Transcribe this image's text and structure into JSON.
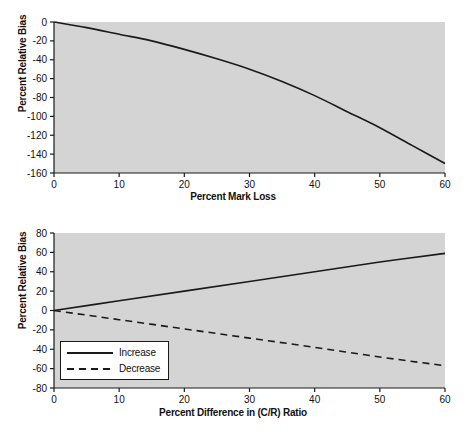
{
  "figure": {
    "background_color": "#ffffff",
    "plot_background_color": "#d4d4d4",
    "line_color": "#1a1a1a"
  },
  "chart_data": [
    {
      "id": "top",
      "type": "line",
      "title": "",
      "xlabel": "Percent Mark Loss",
      "ylabel": "Percent Relative Bias",
      "xlim": [
        0,
        60
      ],
      "ylim": [
        -160,
        0
      ],
      "xticks": [
        0,
        10,
        20,
        30,
        40,
        50,
        60
      ],
      "yticks": [
        0,
        -20,
        -40,
        -60,
        -80,
        -100,
        -120,
        -140,
        -160
      ],
      "xticklabels": [
        "0",
        "10",
        "20",
        "30",
        "40",
        "50",
        "60"
      ],
      "yticklabels": [
        "0",
        "-20",
        "-40",
        "-60",
        "-80",
        "-100",
        "-120",
        "-140",
        "-160"
      ],
      "grid": false,
      "legend": null,
      "series": [
        {
          "name": "Percent Relative Bias",
          "style": "solid",
          "x": [
            0,
            5,
            10,
            15,
            20,
            25,
            30,
            35,
            40,
            45,
            50,
            55,
            60
          ],
          "values": [
            0,
            -6,
            -13,
            -20,
            -29,
            -39,
            -50,
            -63,
            -78,
            -95,
            -112,
            -131,
            -150
          ]
        }
      ]
    },
    {
      "id": "bottom",
      "type": "line",
      "title": "",
      "xlabel": "Percent Difference in (C/R) Ratio",
      "ylabel": "Percent Relative Bias",
      "xlim": [
        0,
        60
      ],
      "ylim": [
        -80,
        80
      ],
      "xticks": [
        0,
        10,
        20,
        30,
        40,
        50,
        60
      ],
      "yticks": [
        80,
        60,
        40,
        20,
        0,
        -20,
        -40,
        -60,
        -80
      ],
      "xticklabels": [
        "0",
        "10",
        "20",
        "30",
        "40",
        "50",
        "60"
      ],
      "yticklabels": [
        "80",
        "60",
        "40",
        "20",
        "0",
        "-20",
        "-40",
        "-60",
        "-80"
      ],
      "grid": false,
      "legend": {
        "position": "lower-left",
        "entries": [
          {
            "label": "Increase",
            "style": "solid"
          },
          {
            "label": "Decrease",
            "style": "dashed"
          }
        ]
      },
      "series": [
        {
          "name": "Increase",
          "style": "solid",
          "x": [
            0,
            10,
            20,
            30,
            40,
            50,
            60
          ],
          "values": [
            0,
            10,
            20,
            30,
            40,
            50,
            59
          ]
        },
        {
          "name": "Decrease",
          "style": "dashed",
          "x": [
            0,
            10,
            20,
            30,
            40,
            50,
            60
          ],
          "values": [
            0,
            -9.5,
            -19,
            -28.5,
            -38,
            -48,
            -57
          ]
        }
      ]
    }
  ]
}
